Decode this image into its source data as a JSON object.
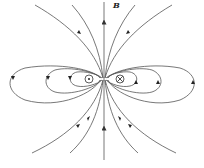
{
  "figure": {
    "field_label": "B",
    "left_conductor": {
      "symbol": "dot-in-circle",
      "meaning": "current out of page"
    },
    "right_conductor": {
      "symbol": "cross-in-circle",
      "meaning": "current into page"
    },
    "line_color": "#444444",
    "caption_fragment": "…"
  }
}
